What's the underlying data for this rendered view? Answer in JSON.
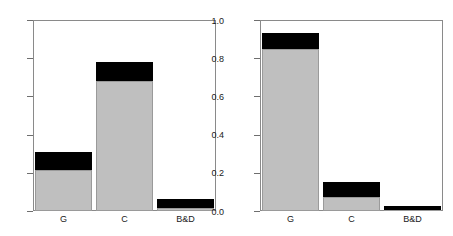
{
  "figure": {
    "panel_count": 2,
    "background_color": "#ffffff",
    "axis_color": "#8a8a8a",
    "gray_color": "#bfbfbf",
    "black_color": "#000000"
  },
  "chart_data": [
    {
      "type": "bar",
      "panel": "left",
      "title": "",
      "subtitle": "",
      "xlabel": "",
      "ylabel": "",
      "categories": [
        "G",
        "C",
        "B&D"
      ],
      "ytick_labels": [
        "0.0",
        "0.2",
        "0.4",
        "0.6",
        "0.8",
        "1.0"
      ],
      "ytick_values": [
        0.0,
        0.2,
        0.4,
        0.6,
        0.8,
        1.0
      ],
      "ylim": [
        0.0,
        1.0
      ],
      "xlim": [
        0,
        3
      ],
      "grid": false,
      "legend": "none",
      "stacked": true,
      "series": [
        {
          "name": "gray",
          "color": "#bfbfbf",
          "values": [
            0.215,
            0.68,
            0.015
          ]
        },
        {
          "name": "black",
          "color": "#000000",
          "values": [
            0.095,
            0.1,
            0.048
          ]
        }
      ],
      "totals": [
        0.31,
        0.78,
        0.063
      ]
    },
    {
      "type": "bar",
      "panel": "right",
      "title": "",
      "subtitle": "",
      "xlabel": "",
      "ylabel": "",
      "categories": [
        "G",
        "C",
        "B&D"
      ],
      "ytick_labels": [
        "0.0",
        "0.2",
        "0.4",
        "0.6",
        "0.8",
        "1.0"
      ],
      "ytick_values": [
        0.0,
        0.2,
        0.4,
        0.6,
        0.8,
        1.0
      ],
      "ylim": [
        0.0,
        1.0
      ],
      "xlim": [
        0,
        3
      ],
      "grid": false,
      "legend": "none",
      "stacked": true,
      "series": [
        {
          "name": "gray",
          "color": "#bfbfbf",
          "values": [
            0.85,
            0.075,
            0.005
          ]
        },
        {
          "name": "black",
          "color": "#000000",
          "values": [
            0.08,
            0.075,
            0.02
          ]
        }
      ],
      "totals": [
        0.93,
        0.15,
        0.025
      ]
    }
  ]
}
